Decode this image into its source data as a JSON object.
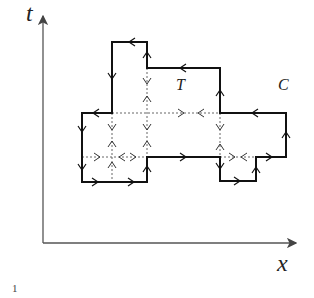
{
  "labels": {
    "t_axis": "t",
    "x_axis": "x",
    "region_T": "T",
    "contour_C": "C",
    "page_number": "1"
  },
  "colors": {
    "solid": "#111111",
    "axis": "#555555",
    "dotted": "#666666"
  },
  "diagram": {
    "axes": {
      "origin": [
        43,
        243
      ],
      "t_tip": [
        43,
        12
      ],
      "x_tip": [
        300,
        243
      ]
    },
    "contour_C_vertices": [
      [
        112,
        42
      ],
      [
        147,
        42
      ],
      [
        147,
        68
      ],
      [
        220,
        68
      ],
      [
        220,
        113
      ],
      [
        286,
        113
      ],
      [
        286,
        157
      ],
      [
        256,
        157
      ],
      [
        256,
        181
      ],
      [
        220,
        181
      ],
      [
        220,
        157
      ],
      [
        147,
        157
      ],
      [
        147,
        182
      ],
      [
        82,
        182
      ],
      [
        82,
        113
      ],
      [
        112,
        113
      ]
    ],
    "dotted_lines": [
      {
        "from": [
          112,
          113
        ],
        "to": [
          220,
          113
        ]
      },
      {
        "from": [
          147,
          68
        ],
        "to": [
          147,
          157
        ]
      },
      {
        "from": [
          112,
          113
        ],
        "to": [
          112,
          182
        ]
      },
      {
        "from": [
          82,
          157
        ],
        "to": [
          147,
          157
        ]
      },
      {
        "from": [
          220,
          113
        ],
        "to": [
          220,
          157
        ]
      },
      {
        "from": [
          220,
          157
        ],
        "to": [
          256,
          157
        ]
      }
    ]
  }
}
